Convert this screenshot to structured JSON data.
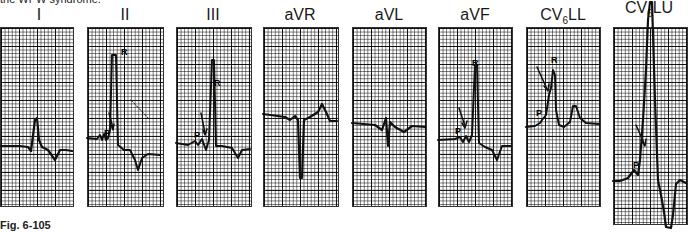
{
  "header_text": "the WPW syndrome.",
  "caption": {
    "fig_label": "Fig. 6-105",
    "text": "Use the long-vertical-bar lead placement... (caption cut off)"
  },
  "leads": [
    {
      "id": "I",
      "label": "I",
      "sub": "",
      "suffix": ""
    },
    {
      "id": "II",
      "label": "II",
      "sub": "",
      "suffix": ""
    },
    {
      "id": "III",
      "label": "III",
      "sub": "",
      "suffix": ""
    },
    {
      "id": "aVR",
      "label": "aVR",
      "sub": "",
      "suffix": ""
    },
    {
      "id": "aVL",
      "label": "aVL",
      "sub": "",
      "suffix": ""
    },
    {
      "id": "aVF",
      "label": "aVF",
      "sub": "",
      "suffix": ""
    },
    {
      "id": "CV6LL",
      "label": "CV",
      "sub": "6",
      "suffix": "LL"
    },
    {
      "id": "CV6LU",
      "label": "CV",
      "sub": "6",
      "suffix": "LU"
    }
  ],
  "annotations": {
    "p_wave": "P",
    "r_wave": "R"
  }
}
